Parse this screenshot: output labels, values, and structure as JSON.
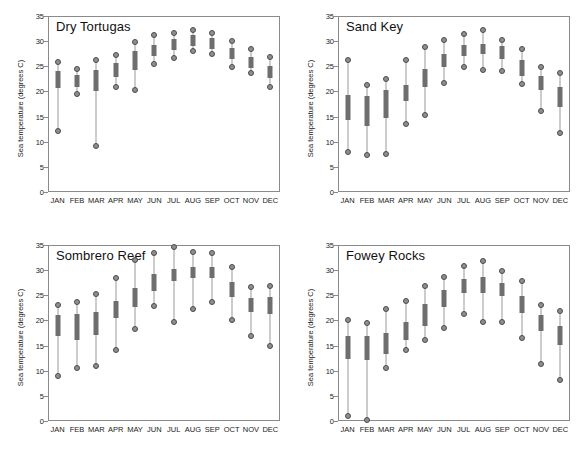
{
  "figure": {
    "width": 580,
    "height": 458,
    "background": "#ffffff",
    "box_color": "#6e6e6e",
    "whisker_color": "#9a9a9a",
    "marker_color": "#8f8f8f",
    "marker_edge_color": "#4a4a4a",
    "frame_color": "#8a8a8a"
  },
  "chart_data": [
    {
      "type": "box",
      "title": "Dry Tortugas",
      "xlabel": "",
      "ylabel": "Sea temperature (degrees C)",
      "ylim": [
        0,
        35
      ],
      "yticks": [
        0,
        5,
        10,
        15,
        20,
        25,
        30,
        35
      ],
      "ytick_labels": [
        "0",
        "5",
        "10",
        "15",
        "20",
        "25",
        "30",
        "35"
      ],
      "grid": false,
      "legend": "none",
      "categories": [
        "JAN",
        "FEB",
        "MAR",
        "APR",
        "MAY",
        "JUN",
        "JUL",
        "AUG",
        "SEP",
        "OCT",
        "NOV",
        "DEC"
      ],
      "boxes": [
        {
          "month": "JAN",
          "min": 12.2,
          "q1": 20.6,
          "q3": 24.1,
          "max": 25.8
        },
        {
          "month": "FEB",
          "min": 19.5,
          "q1": 20.8,
          "q3": 23.2,
          "max": 24.4
        },
        {
          "month": "MAR",
          "min": 9.2,
          "q1": 20.0,
          "q3": 24.2,
          "max": 26.3
        },
        {
          "month": "APR",
          "min": 20.8,
          "q1": 22.9,
          "q3": 25.6,
          "max": 27.2
        },
        {
          "month": "MAY",
          "min": 20.3,
          "q1": 24.2,
          "q3": 28.0,
          "max": 29.8
        },
        {
          "month": "JUN",
          "min": 25.4,
          "q1": 27.1,
          "q3": 29.3,
          "max": 31.2
        },
        {
          "month": "JUL",
          "min": 26.7,
          "q1": 28.3,
          "q3": 30.4,
          "max": 31.7
        },
        {
          "month": "AUG",
          "min": 28.0,
          "q1": 29.1,
          "q3": 31.2,
          "max": 32.3
        },
        {
          "month": "SEP",
          "min": 27.4,
          "q1": 28.5,
          "q3": 30.6,
          "max": 31.7
        },
        {
          "month": "OCT",
          "min": 24.9,
          "q1": 26.5,
          "q3": 28.6,
          "max": 30.1
        },
        {
          "month": "NOV",
          "min": 23.6,
          "q1": 24.6,
          "q3": 26.8,
          "max": 28.5
        },
        {
          "month": "DEC",
          "min": 20.8,
          "q1": 22.7,
          "q3": 25.0,
          "max": 26.9
        }
      ]
    },
    {
      "type": "box",
      "title": "Sand Key",
      "xlabel": "",
      "ylabel": "Sea temperature (degrees C)",
      "ylim": [
        0,
        35
      ],
      "yticks": [
        0,
        5,
        10,
        15,
        20,
        25,
        30,
        35
      ],
      "ytick_labels": [
        "0",
        "5",
        "10",
        "15",
        "20",
        "25",
        "30",
        "35"
      ],
      "grid": false,
      "legend": "none",
      "categories": [
        "JAN",
        "FEB",
        "MAR",
        "APR",
        "MAY",
        "JUN",
        "JUL",
        "AUG",
        "SEP",
        "OCT",
        "NOV",
        "DEC"
      ],
      "boxes": [
        {
          "month": "JAN",
          "min": 7.9,
          "q1": 14.4,
          "q3": 19.3,
          "max": 26.2
        },
        {
          "month": "FEB",
          "min": 7.4,
          "q1": 13.2,
          "q3": 19.1,
          "max": 21.2
        },
        {
          "month": "MAR",
          "min": 7.6,
          "q1": 14.8,
          "q3": 20.2,
          "max": 22.5
        },
        {
          "month": "APR",
          "min": 13.5,
          "q1": 18.0,
          "q3": 21.3,
          "max": 26.2
        },
        {
          "month": "MAY",
          "min": 15.4,
          "q1": 20.9,
          "q3": 24.5,
          "max": 28.9
        },
        {
          "month": "JUN",
          "min": 21.7,
          "q1": 24.9,
          "q3": 27.4,
          "max": 30.3
        },
        {
          "month": "JUL",
          "min": 24.9,
          "q1": 27.1,
          "q3": 29.2,
          "max": 31.5
        },
        {
          "month": "AUG",
          "min": 24.2,
          "q1": 27.5,
          "q3": 29.5,
          "max": 32.2
        },
        {
          "month": "SEP",
          "min": 24.1,
          "q1": 26.4,
          "q3": 29.0,
          "max": 30.3
        },
        {
          "month": "OCT",
          "min": 21.4,
          "q1": 23.1,
          "q3": 26.2,
          "max": 28.4
        },
        {
          "month": "NOV",
          "min": 16.2,
          "q1": 20.2,
          "q3": 23.0,
          "max": 24.8
        },
        {
          "month": "DEC",
          "min": 11.8,
          "q1": 16.9,
          "q3": 20.9,
          "max": 23.7
        }
      ]
    },
    {
      "type": "box",
      "title": "Sombrero Reef",
      "xlabel": "",
      "ylabel": "Sea temperature (degrees C)",
      "ylim": [
        0,
        35
      ],
      "yticks": [
        0,
        5,
        10,
        15,
        20,
        25,
        30,
        35
      ],
      "ytick_labels": [
        "0",
        "5",
        "10",
        "15",
        "20",
        "25",
        "30",
        "35"
      ],
      "grid": false,
      "legend": "none",
      "categories": [
        "JAN",
        "FEB",
        "MAR",
        "APR",
        "MAY",
        "JUN",
        "JUL",
        "AUG",
        "SEP",
        "OCT",
        "NOV",
        "DEC"
      ],
      "boxes": [
        {
          "month": "JAN",
          "min": 9.0,
          "q1": 17.0,
          "q3": 21.1,
          "max": 23.0
        },
        {
          "month": "FEB",
          "min": 10.5,
          "q1": 16.2,
          "q3": 21.2,
          "max": 23.7
        },
        {
          "month": "MAR",
          "min": 11.0,
          "q1": 17.1,
          "q3": 21.7,
          "max": 25.3
        },
        {
          "month": "APR",
          "min": 14.2,
          "q1": 20.4,
          "q3": 23.8,
          "max": 28.5
        },
        {
          "month": "MAY",
          "min": 18.3,
          "q1": 22.6,
          "q3": 26.5,
          "max": 32.0
        },
        {
          "month": "JUN",
          "min": 22.9,
          "q1": 25.9,
          "q3": 29.2,
          "max": 33.4
        },
        {
          "month": "JUL",
          "min": 19.7,
          "q1": 27.8,
          "q3": 30.3,
          "max": 34.6
        },
        {
          "month": "AUG",
          "min": 22.3,
          "q1": 28.4,
          "q3": 30.6,
          "max": 33.6
        },
        {
          "month": "SEP",
          "min": 23.6,
          "q1": 28.4,
          "q3": 30.6,
          "max": 33.5
        },
        {
          "month": "OCT",
          "min": 20.0,
          "q1": 24.6,
          "q3": 27.6,
          "max": 30.7
        },
        {
          "month": "NOV",
          "min": 17.0,
          "q1": 21.6,
          "q3": 24.4,
          "max": 26.7
        },
        {
          "month": "DEC",
          "min": 14.9,
          "q1": 21.2,
          "q3": 24.6,
          "max": 26.9
        }
      ]
    },
    {
      "type": "box",
      "title": "Fowey Rocks",
      "xlabel": "",
      "ylabel": "Sea temperature (degrees C)",
      "ylim": [
        0,
        35
      ],
      "yticks": [
        0,
        5,
        10,
        15,
        20,
        25,
        30,
        35
      ],
      "ytick_labels": [
        "0",
        "5",
        "10",
        "15",
        "20",
        "25",
        "30",
        "35"
      ],
      "grid": false,
      "legend": "none",
      "categories": [
        "JAN",
        "FEB",
        "MAR",
        "APR",
        "MAY",
        "JUN",
        "JUL",
        "AUG",
        "SEP",
        "OCT",
        "NOV",
        "DEC"
      ],
      "boxes": [
        {
          "month": "JAN",
          "min": 0.9,
          "q1": 12.4,
          "q3": 16.9,
          "max": 20.1
        },
        {
          "month": "FEB",
          "min": 0.2,
          "q1": 12.2,
          "q3": 16.9,
          "max": 19.4
        },
        {
          "month": "MAR",
          "min": 10.6,
          "q1": 13.3,
          "q3": 17.5,
          "max": 22.3
        },
        {
          "month": "APR",
          "min": 14.1,
          "q1": 16.1,
          "q3": 19.6,
          "max": 23.9
        },
        {
          "month": "MAY",
          "min": 16.2,
          "q1": 18.8,
          "q3": 23.2,
          "max": 26.8
        },
        {
          "month": "JUN",
          "min": 18.5,
          "q1": 22.7,
          "q3": 26.0,
          "max": 28.6
        },
        {
          "month": "JUL",
          "min": 21.2,
          "q1": 25.4,
          "q3": 28.2,
          "max": 30.9
        },
        {
          "month": "AUG",
          "min": 19.6,
          "q1": 25.5,
          "q3": 28.7,
          "max": 31.8
        },
        {
          "month": "SEP",
          "min": 19.6,
          "q1": 24.9,
          "q3": 27.5,
          "max": 29.8
        },
        {
          "month": "OCT",
          "min": 16.5,
          "q1": 21.4,
          "q3": 24.8,
          "max": 27.9
        },
        {
          "month": "NOV",
          "min": 11.3,
          "q1": 17.8,
          "q3": 21.1,
          "max": 23.0
        },
        {
          "month": "DEC",
          "min": 8.2,
          "q1": 15.1,
          "q3": 18.9,
          "max": 21.9
        }
      ]
    }
  ]
}
